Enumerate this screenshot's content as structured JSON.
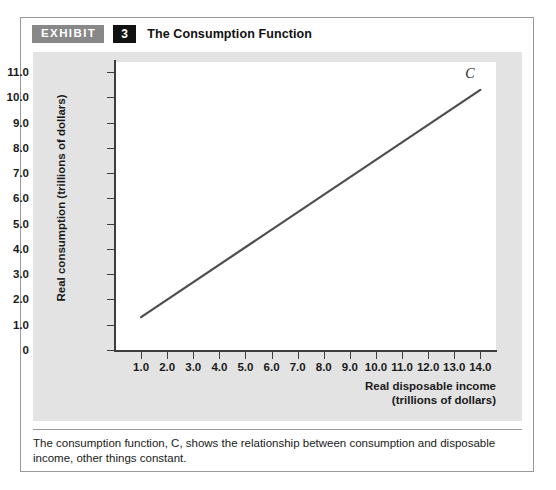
{
  "exhibit": {
    "tag_label": "EXHIBIT",
    "number": "3",
    "title": "The Consumption Function",
    "caption": "The consumption function, C, shows the relationship between consumption and disposable income, other things constant."
  },
  "colors": {
    "tag_background": "#888888",
    "number_background": "#111111",
    "panel_background": "#e3e3e3",
    "plot_background": "#ffffff",
    "axis": "#3d3d3d",
    "curve": "#4d4d4d",
    "card_border": "#9a9a9a"
  },
  "chart_data": {
    "type": "line",
    "title": "The Consumption Function",
    "xlabel": "Real disposable income",
    "xlabel_units": "(trillions of dollars)",
    "ylabel": "Real consumption (trillions of dollars)",
    "xlim": [
      0,
      14.6
    ],
    "ylim": [
      0,
      11.4
    ],
    "grid": false,
    "legend": "none",
    "xticks": [
      "1.0",
      "2.0",
      "3.0",
      "4.0",
      "5.0",
      "6.0",
      "7.0",
      "8.0",
      "9.0",
      "10.0",
      "11.0",
      "12.0",
      "13.0",
      "14.0"
    ],
    "xtick_values": [
      1,
      2,
      3,
      4,
      5,
      6,
      7,
      8,
      9,
      10,
      11,
      12,
      13,
      14
    ],
    "yticks": [
      "0",
      "1.0",
      "2.0",
      "3.0",
      "4.0",
      "5.0",
      "6.0",
      "7.0",
      "8.0",
      "9.0",
      "10.0",
      "11.0"
    ],
    "ytick_values": [
      0,
      1,
      2,
      3,
      4,
      5,
      6,
      7,
      8,
      9,
      10,
      11
    ],
    "series": [
      {
        "name": "C",
        "annotation": "C",
        "x": [
          1.0,
          14.0
        ],
        "values": [
          1.3,
          10.3
        ]
      }
    ]
  }
}
